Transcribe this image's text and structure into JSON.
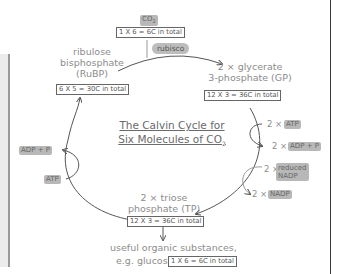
{
  "diagram": {
    "title_line1": "The Calvin Cycle for",
    "title_line2": "Six Molecules of CO",
    "title_sub": "2",
    "co2": {
      "label": "CO",
      "sub": "2",
      "total": "1 X 6 = 6C in total"
    },
    "enzyme": "rubisco",
    "rubp": {
      "line1": "ribulose",
      "line2": "bisphosphate",
      "line3": "(RuBP)",
      "total": "6 X 5 = 30C in total"
    },
    "gp": {
      "line1": "2 × glycerate",
      "line2": "3-phosphate (GP)",
      "total": "12 X 3 = 36C in total"
    },
    "tp": {
      "line1": "2 × triose",
      "line2": "phosphate (TP)",
      "total": "12 X 3 = 36C in total"
    },
    "output": {
      "line1": "useful organic substances,",
      "line2": "e.g. glucose",
      "total": "1 X 6 = 6C in total"
    },
    "right_inputs": {
      "atp_mult": "2 ×",
      "atp": "ATP",
      "adp_mult": "2 ×",
      "adp": "ADP + P",
      "nadph_mult": "2 ×",
      "nadph_line1": "reduced",
      "nadph_line2": "NADP",
      "nadp_mult": "2 ×",
      "nadp": "NADP"
    },
    "left_inputs": {
      "adp": "ADP + P",
      "atp": "ATP"
    }
  }
}
